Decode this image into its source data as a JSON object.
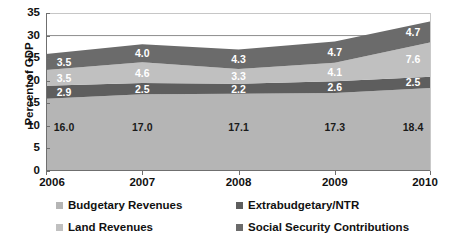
{
  "chart_data": {
    "type": "area",
    "stacked": true,
    "title": "",
    "subtitle": "",
    "xlabel": "",
    "ylabel": "Percent of GDP",
    "categories": [
      "2006",
      "2007",
      "2008",
      "2009",
      "2010"
    ],
    "x": [
      2006,
      2007,
      2008,
      2009,
      2010
    ],
    "ylim": [
      0,
      35
    ],
    "yticks": [
      0,
      5,
      10,
      15,
      20,
      25,
      30,
      35
    ],
    "ytick_labels": [
      "0",
      "5",
      "10",
      "15",
      "20",
      "25",
      "30",
      "35"
    ],
    "grid": "horizontal-sparse",
    "gridlines_at": [
      30,
      35
    ],
    "legend_position": "bottom",
    "series": [
      {
        "name": "Budgetary Revenues",
        "color": "#b5b5b5",
        "label_color": "#1a1a1a",
        "values": [
          16.0,
          17.0,
          17.1,
          17.3,
          18.4
        ],
        "labels": [
          "16.0",
          "17.0",
          "17.1",
          "17.3",
          "18.4"
        ]
      },
      {
        "name": "Extrabudgetary/NTR",
        "color": "#5e5e5e",
        "label_color": "#ffffff",
        "values": [
          2.9,
          2.5,
          2.2,
          2.6,
          2.5
        ],
        "labels": [
          "2.9",
          "2.5",
          "2.2",
          "2.6",
          "2.5"
        ]
      },
      {
        "name": "Land Revenues",
        "color": "#c0c0c0",
        "label_color": "#ffffff",
        "values": [
          3.5,
          4.6,
          3.3,
          4.1,
          7.6
        ],
        "labels": [
          "3.5",
          "4.6",
          "3.3",
          "4.1",
          "7.6"
        ]
      },
      {
        "name": "Social Security Contributions",
        "color": "#6b6b6b",
        "label_color": "#ffffff",
        "values": [
          3.5,
          4.0,
          4.3,
          4.7,
          4.7
        ],
        "labels": [
          "3.5",
          "4.0",
          "4.3",
          "4.7",
          "4.7"
        ]
      }
    ],
    "totals": [
      25.9,
      28.1,
      26.9,
      28.7,
      33.2
    ]
  },
  "legend": {
    "items": [
      {
        "label": "Budgetary Revenues",
        "color": "#b5b5b5"
      },
      {
        "label": "Extrabudgetary/NTR",
        "color": "#5e5e5e"
      },
      {
        "label": "Land Revenues",
        "color": "#c0c0c0"
      },
      {
        "label": "Social Security Contributions",
        "color": "#6b6b6b"
      }
    ]
  },
  "axes": {
    "y_title": "Percent of GDP"
  }
}
